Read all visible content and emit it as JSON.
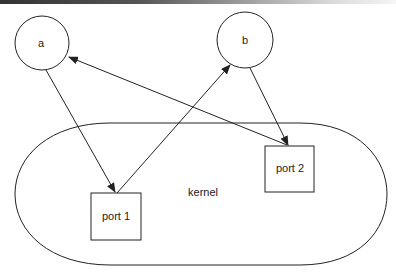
{
  "diagram": {
    "nodes": {
      "a": {
        "label": "a",
        "shape": "circle"
      },
      "b": {
        "label": "b",
        "shape": "circle"
      },
      "port1": {
        "label": "port 1",
        "shape": "box"
      },
      "port2": {
        "label": "port 2",
        "shape": "box"
      },
      "kernel": {
        "label": "kernel",
        "shape": "stadium"
      }
    },
    "edges": [
      {
        "from": "a",
        "to": "port1"
      },
      {
        "from": "port1",
        "to": "b"
      },
      {
        "from": "b",
        "to": "port2"
      },
      {
        "from": "port2",
        "to": "a"
      }
    ],
    "colors": {
      "stroke": "#222222",
      "background": "#ffffff"
    }
  }
}
